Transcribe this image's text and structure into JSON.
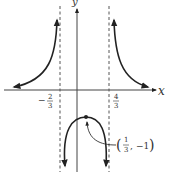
{
  "figure": {
    "type": "function-graph",
    "axes": {
      "x_label": "x",
      "y_label": "y"
    },
    "asymptotes": [
      {
        "x_num": "2",
        "x_den": "3",
        "x_sign": "−",
        "label": "−2/3",
        "style": "dashed"
      },
      {
        "x_num": "4",
        "x_den": "3",
        "x_sign": "",
        "label": "4/3",
        "style": "dashed"
      }
    ],
    "point": {
      "label": "(1/3, −1)",
      "x_num": "1",
      "x_den": "3",
      "y": "−1",
      "open_paren": "(",
      "close_paren": ")",
      "comma": ","
    },
    "colors": {
      "curve": "#222222",
      "axis": "#444444",
      "asymptote": "#555555",
      "text": "#333333"
    }
  }
}
